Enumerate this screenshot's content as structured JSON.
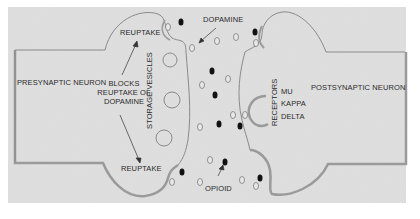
{
  "diagram": {
    "colors": {
      "background": "#dcdcdc",
      "outline": "#8a8a8a",
      "membrane_thick": "#9a9a9a",
      "molecule_dopamine": "#e0e0e0",
      "molecule_opioid": "#111111",
      "text": "#2a2a2a"
    },
    "labels": {
      "presynaptic": "PRESYNAPTIC NEURON",
      "postsynaptic": "POSTSYNAPTIC NEURON",
      "reuptake_top": "REUPTAKE",
      "reuptake_bottom": "REUPTAKE",
      "blocks_line1": "BLOCKS",
      "blocks_line2": "REUPTAKE OF",
      "blocks_line3": "DOPAMINE",
      "storage_vesicles": "STORAGE VESICLES",
      "dopamine": "DOPAMINE",
      "opioid": "OPIOID",
      "receptors": "RECEPTORS",
      "receptor_types": [
        "MU",
        "KAPPA",
        "DELTA"
      ]
    },
    "legend": {
      "hollow_circle": "dopamine",
      "filled_circle": "opioid"
    }
  }
}
